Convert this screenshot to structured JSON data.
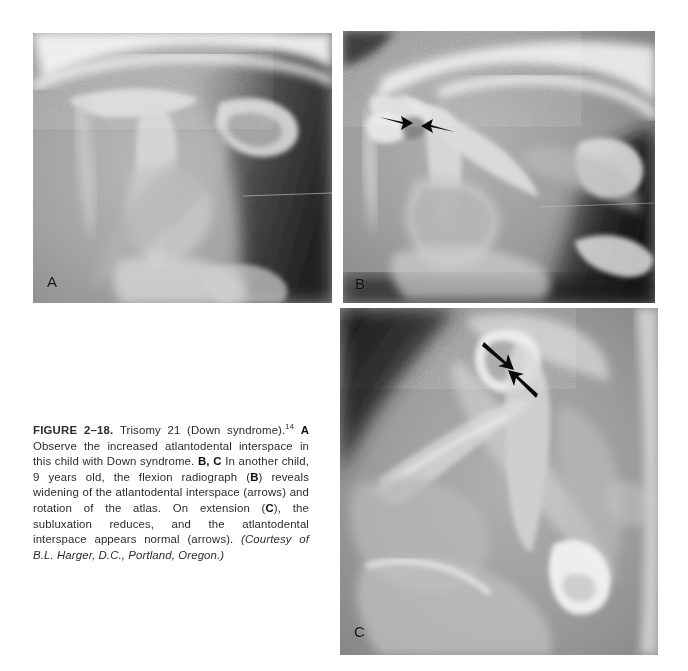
{
  "figure": {
    "number_label": "FIGURE 2–18.",
    "title": "Trisomy 21 (Down syndrome)",
    "reference_superscript": "14",
    "caption_segments": {
      "label_a": "A",
      "text_a": " Observe the increased atlantodental interspace in this child with Down syndrome. ",
      "label_bc": "B, C",
      "text_bc_1": " In another child, 9 years old, the flexion radiograph (",
      "label_b_inline": "B",
      "text_bc_2": ") reveals widening of the atlantodental interspace (arrows) and rotation of the atlas. On extension (",
      "label_c_inline": "C",
      "text_bc_3": "), the subluxation reduces, and the atlantodental interspace appears normal (arrows). "
    },
    "courtesy": "(Courtesy of B.L. Harger, D.C., Portland, Oregon.)",
    "full_caption_plaintext": "FIGURE 2-18. Trisomy 21 (Down syndrome).14 A Observe the increased atlantodental interspace in this child with Down syndrome. B, C In another child, 9 years old, the flexion radiograph (B) reveals widening of the atlantodental interspace (arrows) and rotation of the atlas. On extension (C), the subluxation reduces, and the atlantodental interspace appears normal (arrows). (Courtesy of B.L. Harger, D.C., Portland, Oregon.)"
  },
  "panels": [
    {
      "id": "a",
      "letter": "A",
      "modality": "radiograph",
      "view": "lateral cervical spine",
      "subject": "child with Down syndrome",
      "finding": "increased atlantodental interspace",
      "arrows": []
    },
    {
      "id": "b",
      "letter": "B",
      "modality": "radiograph",
      "view": "lateral cervical spine, flexion",
      "subject": "child, 9 years old",
      "finding": "widening of the atlantodental interspace and rotation of the atlas",
      "arrows": [
        {
          "name": "arrow-interspace-left",
          "direction": "right"
        },
        {
          "name": "arrow-interspace-right",
          "direction": "left"
        }
      ]
    },
    {
      "id": "c",
      "letter": "C",
      "modality": "radiograph",
      "view": "lateral cervical spine, extension",
      "subject": "child, 9 years old",
      "finding": "subluxation reduces, atlantodental interspace appears normal",
      "arrows": [
        {
          "name": "arrow-interspace-upper",
          "direction": "down-right"
        },
        {
          "name": "arrow-interspace-lower",
          "direction": "up-left"
        }
      ]
    }
  ],
  "colors": {
    "page_background": "#ffffff",
    "film_midtone": "#8d8d8d",
    "film_bone_bright": "#efefef",
    "film_air_dark": "#191919",
    "caption_text": "#2b2b2b",
    "annotation_arrow": "#0a0a0a"
  }
}
